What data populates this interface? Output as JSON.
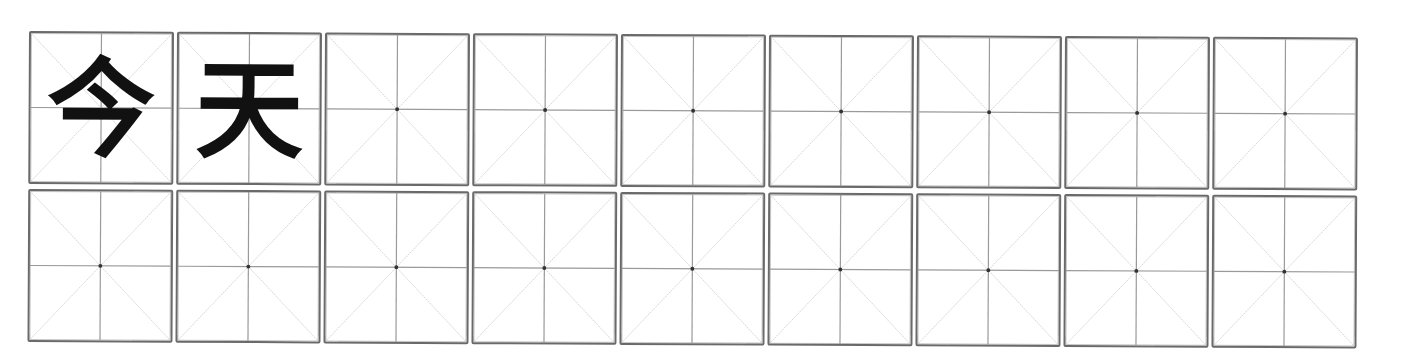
{
  "worksheet": {
    "type": "mi-zi-ge practice grid",
    "rows": 2,
    "columns": 9,
    "colors": {
      "border": "#6a6a6a",
      "center_lines": "#9a9a9a",
      "diagonals": "#bdbdbd",
      "center_dot": "#333333",
      "character": "#111111"
    },
    "row1": {
      "cells": [
        {
          "char": "今"
        },
        {
          "char": "天"
        },
        {
          "char": ""
        },
        {
          "char": ""
        },
        {
          "char": ""
        },
        {
          "char": ""
        },
        {
          "char": ""
        },
        {
          "char": ""
        },
        {
          "char": ""
        }
      ]
    },
    "row2": {
      "cells": [
        {
          "char": ""
        },
        {
          "char": ""
        },
        {
          "char": ""
        },
        {
          "char": ""
        },
        {
          "char": ""
        },
        {
          "char": ""
        },
        {
          "char": ""
        },
        {
          "char": ""
        },
        {
          "char": ""
        }
      ]
    }
  }
}
